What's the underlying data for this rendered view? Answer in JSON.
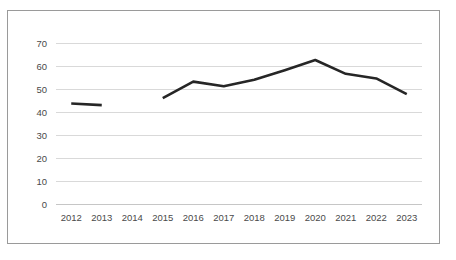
{
  "chart_data": {
    "type": "line",
    "title": "",
    "subtitle": "",
    "xlabel": "",
    "ylabel": "",
    "categories": [
      "2012",
      "2013",
      "2014",
      "2015",
      "2016",
      "2017",
      "2018",
      "2019",
      "2020",
      "2021",
      "2022",
      "2023"
    ],
    "series": [
      {
        "name": "",
        "values": [
          43.7,
          43.0,
          null,
          46.0,
          53.2,
          51.2,
          54.0,
          58.2,
          62.6,
          56.6,
          54.6,
          47.8
        ],
        "color": "#262626"
      }
    ],
    "ylim": [
      0,
      70
    ],
    "yticks": [
      0,
      10,
      20,
      30,
      40,
      50,
      60,
      70
    ],
    "ytick_labels": [
      "0",
      "10",
      "20",
      "30",
      "40",
      "50",
      "60",
      "70"
    ],
    "xtick_labels": [
      "2012",
      "2013",
      "2014",
      "2015",
      "2016",
      "2017",
      "2018",
      "2019",
      "2020",
      "2021",
      "2022",
      "2023"
    ],
    "grid": "horizontal",
    "legend": "none",
    "gap_years": [
      "2014"
    ],
    "annotations": []
  },
  "figure": {
    "border_color": "#9a9a9a",
    "grid_color": "#d9d9d9",
    "tick_label_color": "#4a4a4a",
    "background": "#ffffff"
  }
}
